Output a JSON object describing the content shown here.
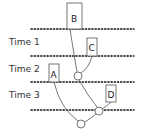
{
  "diagram": {
    "time_labels": [
      {
        "text": "Time 1",
        "x": 9,
        "y": 45
      },
      {
        "text": "Time 2",
        "x": 9,
        "y": 72
      },
      {
        "text": "Time 3",
        "x": 9,
        "y": 98
      }
    ],
    "time_lines_y": [
      29,
      56,
      82,
      110
    ],
    "nodes": [
      {
        "label": "B",
        "x": 67,
        "y": 3,
        "w": 15,
        "h": 26
      },
      {
        "label": "C",
        "x": 87,
        "y": 38,
        "w": 10,
        "h": 18
      },
      {
        "label": "A",
        "x": 49,
        "y": 64,
        "w": 10,
        "h": 18
      },
      {
        "label": "D",
        "x": 106,
        "y": 85,
        "w": 10,
        "h": 17
      }
    ],
    "merge_points": [
      {
        "id": "BC",
        "cx": 78,
        "cy": 76,
        "r": 4
      },
      {
        "id": "BCD",
        "cx": 99,
        "cy": 111,
        "r": 4
      },
      {
        "id": "ABCD",
        "cx": 81,
        "cy": 124,
        "r": 4
      }
    ]
  }
}
